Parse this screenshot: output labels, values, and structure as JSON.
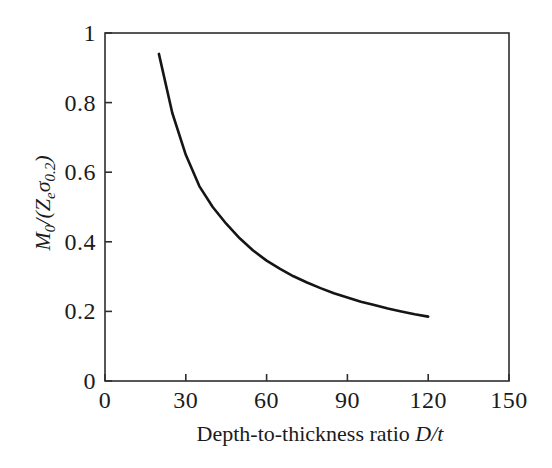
{
  "figure": {
    "background": "#ffffff",
    "text_color": "#1b1b1b",
    "axis_color": "#2e2e2e",
    "curve_color": "#151515"
  },
  "labels": {
    "ylabel_parts": {
      "m": "M",
      "sub_zero": "0",
      "slash_open": "/(",
      "z": "Z",
      "sub_e": "e",
      "sigma": "σ",
      "sub_zero_two": "0.2",
      "close": ")"
    },
    "xlabel_parts": {
      "text": "Depth-to-thickness ratio ",
      "variable": "D/t"
    }
  },
  "chart_data": {
    "type": "line",
    "title": "",
    "xlabel": "Depth-to-thickness ratio D/t",
    "ylabel": "M0/(Ze σ0.2)",
    "xlim": [
      0,
      150
    ],
    "ylim": [
      0,
      1
    ],
    "x_ticks": [
      0,
      30,
      60,
      90,
      120,
      150
    ],
    "y_ticks": [
      0,
      0.2,
      0.4,
      0.6,
      0.8,
      1
    ],
    "x_tick_labels": [
      "0",
      "30",
      "60",
      "90",
      "120",
      "150"
    ],
    "y_tick_labels": [
      "0",
      "0.2",
      "0.4",
      "0.6",
      "0.8",
      "1"
    ],
    "grid": false,
    "legend_position": "none",
    "series": [
      {
        "name": "M0/(Ze σ0.2) vs D/t",
        "x": [
          20,
          25,
          30,
          35,
          40,
          45,
          50,
          55,
          60,
          65,
          70,
          75,
          80,
          85,
          90,
          95,
          100,
          105,
          110,
          115,
          120
        ],
        "y": [
          0.94,
          0.77,
          0.65,
          0.56,
          0.5,
          0.452,
          0.41,
          0.375,
          0.346,
          0.322,
          0.301,
          0.283,
          0.267,
          0.252,
          0.24,
          0.228,
          0.218,
          0.208,
          0.2,
          0.192,
          0.185
        ]
      }
    ]
  }
}
